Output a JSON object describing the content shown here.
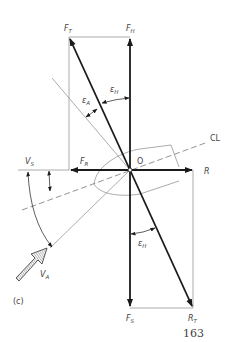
{
  "figure": {
    "panel_label": "(c)",
    "page_number": "163",
    "origin_label": "O",
    "centerline_label": "CL",
    "vectors": {
      "F_T": {
        "main": "F",
        "sub": "T"
      },
      "F_H": {
        "main": "F",
        "sub": "H"
      },
      "F_R": {
        "main": "F",
        "sub": "R"
      },
      "F_S": {
        "main": "F",
        "sub": "S"
      },
      "R": {
        "main": "R",
        "sub": ""
      },
      "R_T": {
        "main": "R",
        "sub": "T"
      },
      "V_S": {
        "main": "V",
        "sub": "S"
      },
      "V_A": {
        "main": "V",
        "sub": "A"
      }
    },
    "angles": {
      "eps_A": {
        "main": "ε",
        "sub": "A"
      },
      "eps_H_top": {
        "main": "ε",
        "sub": "H"
      },
      "eps_H_bottom": {
        "main": "ε",
        "sub": "H"
      }
    },
    "colors": {
      "heavy": "#1a1a1a",
      "thin": "#777777",
      "text": "#444444"
    }
  }
}
